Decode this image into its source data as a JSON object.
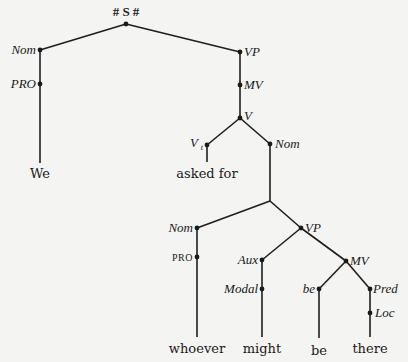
{
  "diagram": {
    "type": "syntax-tree",
    "root_label": "# S #",
    "nodes": {
      "s": {
        "label": "# S #",
        "x": 126,
        "y": 24
      },
      "nom1": {
        "label": "Nom",
        "x": 40,
        "y": 50
      },
      "pro1": {
        "label": "PRO",
        "x": 40,
        "y": 84
      },
      "vp1": {
        "label": "VP",
        "x": 240,
        "y": 52
      },
      "mv1": {
        "label": "MV",
        "x": 240,
        "y": 85
      },
      "v": {
        "label": "V",
        "x": 240,
        "y": 118
      },
      "vt": {
        "label": "V",
        "subscript": "t",
        "x": 207,
        "y": 145
      },
      "nom2": {
        "label": "Nom",
        "x": 270,
        "y": 144
      },
      "junction": {
        "label": "",
        "x": 270,
        "y": 201
      },
      "nom3": {
        "label": "Nom",
        "x": 197,
        "y": 228
      },
      "pro2": {
        "label": "PRO",
        "x": 197,
        "y": 257
      },
      "vp2": {
        "label": "VP",
        "x": 301,
        "y": 228
      },
      "aux": {
        "label": "Aux",
        "x": 262,
        "y": 260
      },
      "modal": {
        "label": "Modal",
        "x": 262,
        "y": 289
      },
      "mv2": {
        "label": "MV",
        "x": 346,
        "y": 261
      },
      "be": {
        "label": "be",
        "x": 319,
        "y": 289
      },
      "pred": {
        "label": "Pred",
        "x": 370,
        "y": 289
      },
      "loc": {
        "label": "Loc",
        "x": 370,
        "y": 313
      }
    },
    "leaves": [
      {
        "word": "We",
        "x": 40,
        "y": 176
      },
      {
        "word": "asked for",
        "x": 207,
        "y": 176
      },
      {
        "word": "whoever",
        "x": 197,
        "y": 351
      },
      {
        "word": "might",
        "x": 262,
        "y": 351
      },
      {
        "word": "be",
        "x": 319,
        "y": 352
      },
      {
        "word": "there",
        "x": 370,
        "y": 351
      }
    ],
    "edges": [
      [
        "s",
        "nom1"
      ],
      [
        "s",
        "vp1"
      ],
      [
        "nom1",
        "pro1"
      ],
      [
        "pro1",
        "We"
      ],
      [
        "vp1",
        "mv1"
      ],
      [
        "mv1",
        "v"
      ],
      [
        "v",
        "vt"
      ],
      [
        "v",
        "nom2"
      ],
      [
        "vt",
        "asked for"
      ],
      [
        "nom2",
        "junction"
      ],
      [
        "junction",
        "nom3"
      ],
      [
        "junction",
        "vp2"
      ],
      [
        "nom3",
        "pro2"
      ],
      [
        "pro2",
        "whoever"
      ],
      [
        "vp2",
        "aux"
      ],
      [
        "vp2",
        "mv2"
      ],
      [
        "aux",
        "modal"
      ],
      [
        "modal",
        "might"
      ],
      [
        "mv2",
        "be"
      ],
      [
        "mv2",
        "pred"
      ],
      [
        "be",
        "be (word)"
      ],
      [
        "pred",
        "loc"
      ],
      [
        "loc",
        "there"
      ]
    ],
    "colors": {
      "background": "#f4f4f2",
      "ink": "#1a1a1a"
    }
  }
}
